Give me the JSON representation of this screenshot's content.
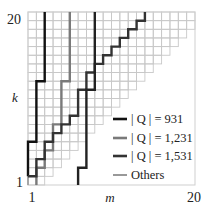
{
  "chart_data": {
    "type": "line",
    "title": "",
    "xlabel": "m",
    "ylabel": "k",
    "xlim": [
      1,
      20
    ],
    "ylim": [
      1,
      20
    ],
    "x_ticks": [
      "1",
      "20"
    ],
    "y_ticks": [
      "1",
      "20"
    ],
    "grid": true,
    "grid_shape": "staircase (upper-left region k >= m-ish)",
    "legend_position": "lower right",
    "series": [
      {
        "name": "|Q| = 931",
        "color": "#111111",
        "width": 2.4,
        "points": [
          [
            0,
            1
          ],
          [
            0,
            5
          ],
          [
            1,
            5
          ],
          [
            1,
            12
          ],
          [
            2,
            12
          ],
          [
            2,
            20
          ]
        ]
      },
      {
        "name": "|Q| = 1,231",
        "color": "#7a7a7a",
        "width": 2.4,
        "points": [
          [
            1,
            0
          ],
          [
            1,
            2
          ],
          [
            2,
            2
          ],
          [
            2,
            4
          ],
          [
            3,
            4
          ],
          [
            3,
            7
          ],
          [
            4,
            7
          ],
          [
            4,
            12
          ],
          [
            5,
            12
          ],
          [
            5,
            20
          ]
        ]
      },
      {
        "name": "|Q| = 1,531",
        "color": "#333333",
        "width": 2.4,
        "points": [
          [
            0,
            1
          ],
          [
            1,
            1
          ],
          [
            1,
            3
          ],
          [
            2,
            3
          ],
          [
            2,
            5
          ],
          [
            3,
            5
          ],
          [
            3,
            6
          ],
          [
            4,
            6
          ],
          [
            4,
            7
          ],
          [
            5,
            7
          ],
          [
            5,
            8
          ],
          [
            6,
            8
          ],
          [
            6,
            11
          ],
          [
            7,
            11
          ],
          [
            7,
            13
          ],
          [
            8,
            13
          ],
          [
            8,
            14
          ],
          [
            9,
            14
          ],
          [
            9,
            15
          ],
          [
            10,
            15
          ],
          [
            10,
            16
          ],
          [
            11,
            16
          ],
          [
            11,
            17
          ],
          [
            12,
            17
          ],
          [
            12,
            18
          ],
          [
            13,
            18
          ],
          [
            13,
            19
          ],
          [
            14,
            19
          ],
          [
            14,
            20
          ]
        ]
      },
      {
        "name": "Others",
        "color": "#999999",
        "width": 1.6,
        "points": [
          [
            0,
            0
          ],
          [
            0,
            1
          ]
        ]
      },
      {
        "name": "steep-dark",
        "color": "#222222",
        "width": 2.4,
        "legend": false,
        "points": [
          [
            6,
            0
          ],
          [
            6,
            0
          ],
          [
            6,
            2
          ],
          [
            7,
            2
          ],
          [
            7,
            11
          ],
          [
            8,
            11
          ],
          [
            8,
            20
          ]
        ]
      }
    ]
  },
  "legend": {
    "items": [
      {
        "label": "| Q | = 931",
        "color": "#111111"
      },
      {
        "label": "| Q | = 1,231",
        "color": "#7a7a7a"
      },
      {
        "label": "| Q | = 1,531",
        "color": "#333333"
      },
      {
        "label": "Others",
        "color": "#999999"
      }
    ]
  },
  "axes": {
    "x_label": "m",
    "y_label": "k",
    "x_min_label": "1",
    "x_max_label": "20",
    "y_min_label": "1",
    "y_max_label": "20"
  }
}
